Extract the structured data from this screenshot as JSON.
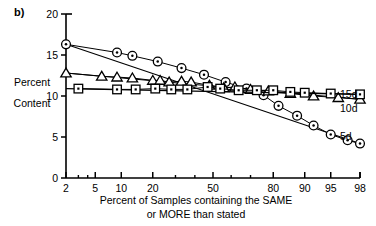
{
  "panel": {
    "label": "b)"
  },
  "axes": {
    "y": {
      "title_line1": "Percent",
      "title_line2": "Content",
      "ticks": [
        "0",
        "5",
        "10",
        "15",
        "20"
      ],
      "tick_values": [
        0,
        5,
        10,
        15,
        20
      ],
      "min": 0,
      "max": 20
    },
    "x": {
      "title_line1": "Percent of Samples containing the SAME",
      "title_line2": "or MORE than stated",
      "ticks": [
        "2",
        "5",
        "10",
        "20",
        "50",
        "80",
        "90",
        "95",
        "98"
      ],
      "tick_values": [
        2,
        5,
        10,
        20,
        50,
        80,
        90,
        95,
        98
      ],
      "minor_tick_values": [
        3,
        4,
        30,
        40,
        60,
        70
      ],
      "scale": "probability",
      "min": 2,
      "max": 98
    }
  },
  "legend": {
    "position": "right-inside",
    "entries": [
      {
        "label": "15d",
        "marker": "square"
      },
      {
        "label": "10d",
        "marker": "triangle"
      },
      {
        "label": "5d",
        "marker": "circle-dot"
      }
    ]
  },
  "chart_data": {
    "type": "scatter",
    "title": "",
    "subtitle": "",
    "xlabel": "Percent of Samples containing the SAME or MORE than stated",
    "ylabel": "Percent Content",
    "xscale": "probability",
    "xlim": [
      2,
      98
    ],
    "ylim": [
      0,
      20
    ],
    "grid": false,
    "legend_position": "right-inside",
    "annotations": [
      "b)"
    ],
    "series": [
      {
        "name": "5d",
        "marker": "circle-dot",
        "fit_line": {
          "x": [
            2,
            98
          ],
          "y": [
            16.3,
            4.2
          ]
        },
        "points": [
          {
            "x": 2,
            "y": 16.3
          },
          {
            "x": 9,
            "y": 15.3
          },
          {
            "x": 13,
            "y": 14.9
          },
          {
            "x": 22,
            "y": 14.2
          },
          {
            "x": 33,
            "y": 13.4
          },
          {
            "x": 45,
            "y": 12.6
          },
          {
            "x": 57,
            "y": 11.7
          },
          {
            "x": 68,
            "y": 10.9
          },
          {
            "x": 76,
            "y": 10.1
          },
          {
            "x": 82,
            "y": 8.8
          },
          {
            "x": 88,
            "y": 7.6
          },
          {
            "x": 92,
            "y": 6.4
          },
          {
            "x": 95,
            "y": 5.3
          },
          {
            "x": 97,
            "y": 4.6
          },
          {
            "x": 98,
            "y": 4.2
          }
        ]
      },
      {
        "name": "10d",
        "marker": "triangle",
        "fit_line": {
          "x": [
            2,
            98
          ],
          "y": [
            12.8,
            9.6
          ]
        },
        "points": [
          {
            "x": 2,
            "y": 12.8
          },
          {
            "x": 6,
            "y": 12.4
          },
          {
            "x": 9,
            "y": 12.3
          },
          {
            "x": 13,
            "y": 12.2
          },
          {
            "x": 20,
            "y": 11.9
          },
          {
            "x": 23,
            "y": 11.9
          },
          {
            "x": 27,
            "y": 11.7
          },
          {
            "x": 33,
            "y": 11.8
          },
          {
            "x": 38,
            "y": 11.7
          },
          {
            "x": 48,
            "y": 11.3
          },
          {
            "x": 56,
            "y": 11.0
          },
          {
            "x": 62,
            "y": 11.1
          },
          {
            "x": 70,
            "y": 10.8
          },
          {
            "x": 78,
            "y": 10.6
          },
          {
            "x": 86,
            "y": 10.3
          },
          {
            "x": 92,
            "y": 10.0
          },
          {
            "x": 96,
            "y": 9.8
          },
          {
            "x": 98,
            "y": 9.6
          }
        ]
      },
      {
        "name": "15d",
        "marker": "square",
        "fit_line": {
          "x": [
            2,
            98
          ],
          "y": [
            10.9,
            10.2
          ]
        },
        "points": [
          {
            "x": 3,
            "y": 10.9
          },
          {
            "x": 9,
            "y": 10.8
          },
          {
            "x": 14,
            "y": 10.8
          },
          {
            "x": 21,
            "y": 10.9
          },
          {
            "x": 28,
            "y": 10.8
          },
          {
            "x": 36,
            "y": 10.8
          },
          {
            "x": 47,
            "y": 11.1
          },
          {
            "x": 54,
            "y": 10.9
          },
          {
            "x": 64,
            "y": 10.7
          },
          {
            "x": 73,
            "y": 10.7
          },
          {
            "x": 80,
            "y": 10.7
          },
          {
            "x": 86,
            "y": 10.5
          },
          {
            "x": 90,
            "y": 10.4
          },
          {
            "x": 95,
            "y": 10.3
          },
          {
            "x": 98,
            "y": 10.2
          }
        ]
      }
    ]
  },
  "colors": {
    "ink": "#000000",
    "background": "#ffffff"
  }
}
